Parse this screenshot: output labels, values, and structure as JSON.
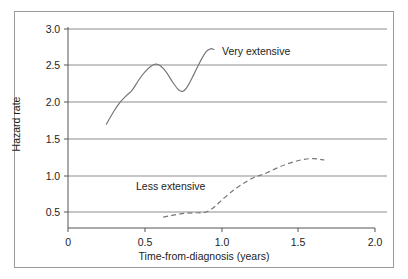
{
  "chart_data": {
    "type": "line",
    "title": "",
    "xlabel": "Time-from-diagnosis (years)",
    "ylabel": "Hazard rate",
    "xlim": [
      0,
      2.0
    ],
    "ylim": [
      0.28,
      3.08
    ],
    "grid": true,
    "grid_axis": "y",
    "legend_position": "inline-annotations",
    "x_ticks": [
      "0",
      "0.5",
      "1.0",
      "1.5",
      "2.0"
    ],
    "x_tick_values": [
      0,
      0.5,
      1.0,
      1.5,
      2.0
    ],
    "y_ticks": [
      "0.5",
      "1.0",
      "1.5",
      "2.0",
      "2.5",
      "3.0"
    ],
    "y_tick_values": [
      0.5,
      1.0,
      1.5,
      2.0,
      2.5,
      3.0
    ],
    "series": [
      {
        "name": "Very extensive",
        "style": "solid",
        "color": "#777777",
        "points": [
          [
            0.25,
            1.7
          ],
          [
            0.3,
            1.88
          ],
          [
            0.34,
            2.0
          ],
          [
            0.38,
            2.09
          ],
          [
            0.42,
            2.17
          ],
          [
            0.46,
            2.3
          ],
          [
            0.5,
            2.41
          ],
          [
            0.54,
            2.49
          ],
          [
            0.57,
            2.52
          ],
          [
            0.6,
            2.5
          ],
          [
            0.64,
            2.41
          ],
          [
            0.68,
            2.28
          ],
          [
            0.72,
            2.17
          ],
          [
            0.75,
            2.15
          ],
          [
            0.78,
            2.22
          ],
          [
            0.82,
            2.38
          ],
          [
            0.86,
            2.55
          ],
          [
            0.9,
            2.69
          ],
          [
            0.93,
            2.73
          ],
          [
            0.95,
            2.72
          ]
        ]
      },
      {
        "name": "Less extensive",
        "style": "dashed",
        "color": "#777777",
        "points": [
          [
            0.62,
            0.43
          ],
          [
            0.67,
            0.45
          ],
          [
            0.72,
            0.47
          ],
          [
            0.78,
            0.485
          ],
          [
            0.84,
            0.49
          ],
          [
            0.88,
            0.49
          ],
          [
            0.92,
            0.52
          ],
          [
            0.96,
            0.58
          ],
          [
            1.0,
            0.66
          ],
          [
            1.05,
            0.75
          ],
          [
            1.1,
            0.83
          ],
          [
            1.15,
            0.9
          ],
          [
            1.2,
            0.96
          ],
          [
            1.25,
            1.0
          ],
          [
            1.3,
            1.04
          ],
          [
            1.36,
            1.1
          ],
          [
            1.42,
            1.15
          ],
          [
            1.48,
            1.19
          ],
          [
            1.54,
            1.22
          ],
          [
            1.6,
            1.23
          ],
          [
            1.64,
            1.22
          ],
          [
            1.67,
            1.21
          ]
        ]
      }
    ],
    "annotations": [
      {
        "text": "Very extensive",
        "x": 1.02,
        "y": 2.62
      },
      {
        "text": "Less extensive",
        "x": 0.5,
        "y": 0.73
      }
    ]
  },
  "axes": {
    "x_title": "Time-from-diagnosis (years)",
    "y_title": "Hazard rate",
    "x_labels": [
      "0",
      "0.5",
      "1.0",
      "1.5",
      "2.0"
    ],
    "y_labels": [
      "3.0",
      "2.5",
      "2.0",
      "1.5",
      "1.0",
      "0.5"
    ]
  },
  "labels": {
    "very_extensive": "Very extensive",
    "less_extensive": "Less extensive"
  },
  "colors": {
    "frame": "#9a9a9a",
    "grid": "#8d8d8d",
    "axis": "#555555",
    "curve": "#777777",
    "text": "#1d1d1d",
    "background": "#ffffff"
  }
}
